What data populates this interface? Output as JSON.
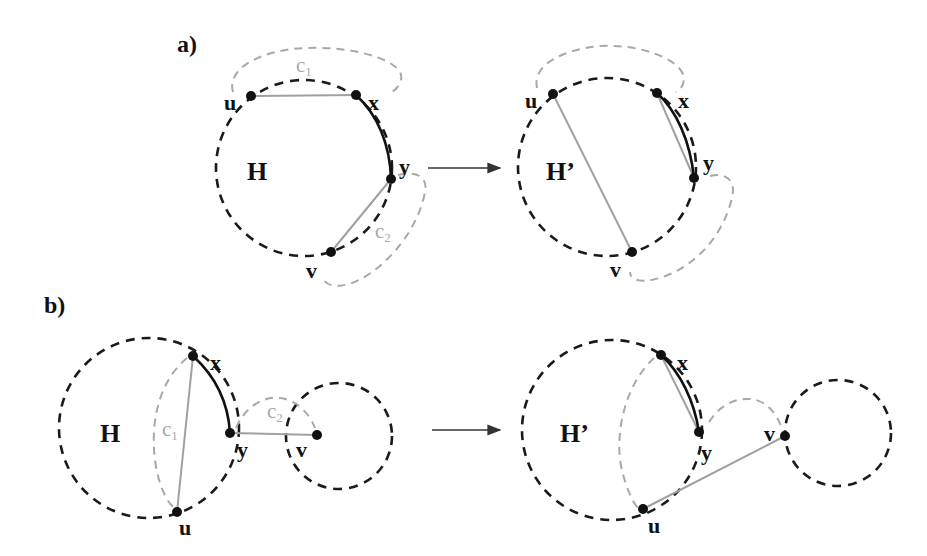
{
  "panels": {
    "a": {
      "label": "a)",
      "before": {
        "graph_label": "H",
        "nodes": {
          "u": "u",
          "x": "x",
          "y": "y",
          "v": "v"
        },
        "cycles": {
          "c1": "c",
          "c1_sub": "1",
          "c2": "c",
          "c2_sub": "2"
        }
      },
      "after": {
        "graph_label": "H’",
        "nodes": {
          "u": "u",
          "x": "x",
          "y": "y",
          "v": "v"
        }
      }
    },
    "b": {
      "label": "b)",
      "before": {
        "graph_label": "H",
        "nodes": {
          "u": "u",
          "x": "x",
          "y": "y",
          "v": "v"
        },
        "cycles": {
          "c1": "c",
          "c1_sub": "1",
          "c2": "c",
          "c2_sub": "2"
        }
      },
      "after": {
        "graph_label": "H’",
        "nodes": {
          "u": "u",
          "x": "x",
          "y": "y",
          "v": "v"
        }
      }
    }
  },
  "colors": {
    "black_dashed": "#1a1a1a",
    "grey_dashed": "#a8a8a8",
    "grey_edge": "#a0a0a0",
    "node": "#111111"
  }
}
